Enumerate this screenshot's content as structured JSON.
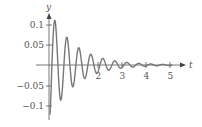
{
  "chart_data": {
    "type": "line",
    "title": "",
    "xlabel": "t",
    "ylabel": "y",
    "x_ticks": [
      2,
      3,
      4,
      5
    ],
    "x_tick_labels": [
      "2",
      "3",
      "4",
      "5"
    ],
    "y_ticks": [
      0.1,
      0.05,
      -0.05,
      -0.1
    ],
    "y_tick_labels": [
      "0.1",
      "0.05",
      "−0.05",
      "−0.1"
    ],
    "xlim": [
      0,
      5.5
    ],
    "ylim": [
      -0.13,
      0.12
    ],
    "grid": false,
    "legend": null,
    "series": [
      {
        "name": "damped oscillation",
        "color": "#777777",
        "description": "Damped oscillation starting near -0.1, peaking at 0.1 near t=0.2, period about 0.5, amplitude decaying toward 0 by t=5",
        "x": [
          0,
          0.05,
          0.2,
          0.5,
          0.7,
          0.95,
          1.2,
          1.45,
          1.7,
          1.95,
          2.2,
          2.45,
          2.7,
          3.0,
          3.5,
          4.0,
          4.5,
          5.0
        ],
        "y": [
          -0.1,
          -0.12,
          0.1,
          -0.08,
          0.06,
          -0.055,
          0.04,
          -0.035,
          0.027,
          -0.022,
          0.018,
          -0.014,
          0.012,
          -0.008,
          0.005,
          -0.003,
          0.002,
          0.001
        ]
      }
    ]
  }
}
